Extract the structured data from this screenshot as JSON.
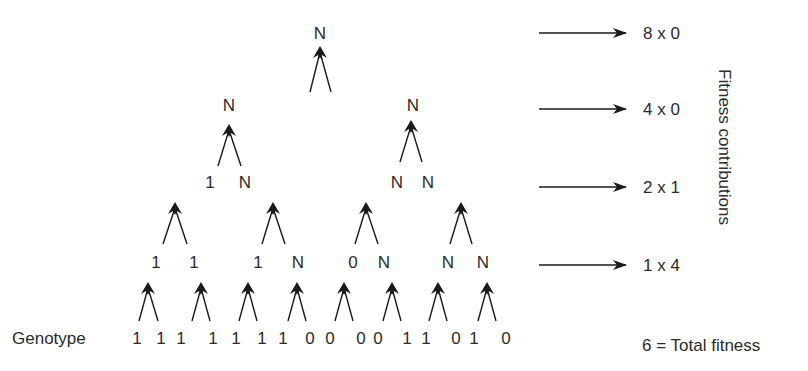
{
  "diagram": {
    "type": "hierarchical fitness tree",
    "genotype_label": "Genotype",
    "genotype": [
      "1",
      "1",
      "1",
      "1",
      "1",
      "1",
      "1",
      "0",
      "0",
      "0",
      "0",
      "1",
      "1",
      "0",
      "1",
      "0"
    ],
    "levels": [
      {
        "level": 1,
        "nodes": [
          "1",
          "1",
          "1",
          "N",
          "0",
          "N",
          "N",
          "N"
        ]
      },
      {
        "level": 2,
        "nodes": [
          "1",
          "N",
          "N",
          "N"
        ]
      },
      {
        "level": 3,
        "nodes": [
          "N",
          "N"
        ]
      },
      {
        "level": 4,
        "nodes": [
          "N"
        ]
      }
    ],
    "contributions": [
      {
        "label": "8 x 0",
        "y": 33
      },
      {
        "label": "4 x 0",
        "y": 109
      },
      {
        "label": "2 x 1",
        "y": 187
      },
      {
        "label": "1 x 4",
        "y": 265
      }
    ],
    "axis_label": "Fitness contributions",
    "total_label": "6 = Total fitness"
  },
  "layout": {
    "genotype_row": {
      "y": 338,
      "x": [
        137,
        161,
        181,
        213,
        236,
        262,
        283,
        310,
        330,
        361,
        378,
        407,
        426,
        456,
        474,
        506
      ]
    },
    "level1_row": {
      "y": 262,
      "x": [
        156,
        194,
        258,
        298,
        353,
        384,
        448,
        483
      ]
    },
    "level2_row": {
      "y": 182,
      "x": [
        210,
        245,
        397,
        428
      ]
    },
    "level3_row": {
      "y": 105,
      "x": [
        229,
        413
      ]
    },
    "level4_row": {
      "y": 33,
      "x": [
        320
      ]
    },
    "forks": [
      {
        "peak": [
          148,
          282
        ],
        "left": [
          139,
          321
        ],
        "right": [
          158,
          321
        ]
      },
      {
        "peak": [
          201,
          282
        ],
        "left": [
          192,
          321
        ],
        "right": [
          210,
          321
        ]
      },
      {
        "peak": [
          248,
          282
        ],
        "left": [
          239,
          321
        ],
        "right": [
          257,
          321
        ]
      },
      {
        "peak": [
          297,
          282
        ],
        "left": [
          288,
          321
        ],
        "right": [
          306,
          321
        ]
      },
      {
        "peak": [
          344,
          282
        ],
        "left": [
          335,
          321
        ],
        "right": [
          353,
          321
        ]
      },
      {
        "peak": [
          392,
          282
        ],
        "left": [
          383,
          321
        ],
        "right": [
          401,
          321
        ]
      },
      {
        "peak": [
          438,
          282
        ],
        "left": [
          429,
          321
        ],
        "right": [
          447,
          321
        ]
      },
      {
        "peak": [
          487,
          282
        ],
        "left": [
          478,
          321
        ],
        "right": [
          496,
          321
        ]
      },
      {
        "peak": [
          175,
          202
        ],
        "left": [
          163,
          244
        ],
        "right": [
          187,
          244
        ]
      },
      {
        "peak": [
          273,
          202
        ],
        "left": [
          262,
          244
        ],
        "right": [
          285,
          244
        ]
      },
      {
        "peak": [
          366,
          202
        ],
        "left": [
          355,
          244
        ],
        "right": [
          378,
          244
        ]
      },
      {
        "peak": [
          461,
          202
        ],
        "left": [
          450,
          244
        ],
        "right": [
          472,
          244
        ]
      },
      {
        "peak": [
          229,
          124
        ],
        "left": [
          218,
          166
        ],
        "right": [
          241,
          166
        ]
      },
      {
        "peak": [
          411,
          120
        ],
        "left": [
          400,
          162
        ],
        "right": [
          422,
          162
        ]
      },
      {
        "peak": [
          320,
          46
        ],
        "left": [
          310,
          92
        ],
        "right": [
          331,
          92
        ]
      }
    ],
    "contribution_arrows": {
      "x1": 539,
      "x2": 626
    },
    "contribution_text_x": 643,
    "total_pos": [
      642,
      345
    ],
    "genotype_label_pos": [
      12,
      338
    ]
  },
  "colors": {
    "ink": "#2b2b2b",
    "arrow": "#1a1a1a",
    "background": "#ffffff"
  }
}
